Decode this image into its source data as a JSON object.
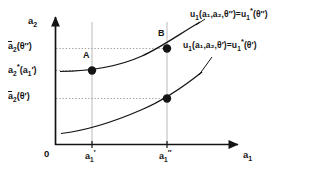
{
  "figure": {
    "type": "indifference-curve-diagram",
    "background": "#ffffff",
    "ink_color": "#141414",
    "guide_color": "#bdbdbd"
  },
  "axes": {
    "x_axis_label": "a",
    "x_axis_sub": "1",
    "y_axis_label": "a",
    "y_axis_sub": "2",
    "origin_label": "0",
    "x_ticks": [
      {
        "id": "a1-prime",
        "base": "a",
        "sub": "1",
        "prime": "′",
        "x_px": 92
      },
      {
        "id": "a1-double-prime",
        "base": "a",
        "sub": "1",
        "prime": "″",
        "x_px": 167
      }
    ],
    "y_ticks": [
      {
        "id": "abar2-theta-double-prime",
        "base": "a",
        "sub": "2",
        "overbar": true,
        "arg": "(θ″)",
        "y_px": 48
      },
      {
        "id": "a2-star-a1-prime",
        "base": "a",
        "sub": "2",
        "star": "*",
        "arg": "(a₁′)",
        "arg_base": "(a",
        "arg_sub": "1",
        "arg_prime": "′)",
        "y_px": 70
      },
      {
        "id": "abar2-theta-prime",
        "base": "a",
        "sub": "2",
        "overbar": true,
        "arg": "(θ′)",
        "y_px": 98
      }
    ]
  },
  "curves": [
    {
      "id": "upper-indifference-curve",
      "label_parts": {
        "u": "u",
        "u_sub": "1",
        "args": "(a₁,a₂,θ″)",
        "equals": "=",
        "u2": "u",
        "u2_sub": "1",
        "u2_sup": "*",
        "u2_args": "(θ″)"
      },
      "label_text": "u₁(a₁,a₂,θ″)=u₁*(θ″)",
      "label_x_px": 193,
      "label_y_px": 10,
      "path": "M 60,71.5 C 92,71 120,66 142,56 C 160,48 178,35 200,22"
    },
    {
      "id": "lower-indifference-curve",
      "label_parts": {
        "u": "u",
        "u_sub": "1",
        "args": "(a₁,a₂,θ′)",
        "equals": "=",
        "u2": "u",
        "u2_sub": "1",
        "u2_sup": "*",
        "u2_args": "(θ′)"
      },
      "label_text": "u₁(a₁,a₂,θ′)=u₁*(θ′)",
      "label_x_px": 186,
      "label_y_px": 41,
      "path": "M 61,133.5 C 90,130 118,120 141,110 C 160,102 182,88 202,72"
    }
  ],
  "points": [
    {
      "id": "point-A",
      "label": "A",
      "x_px": 92,
      "y_px": 70.5,
      "label_x_px": 84,
      "label_y_px": 55
    },
    {
      "id": "point-B",
      "label": "B",
      "x_px": 167,
      "y_px": 48.5,
      "label_x_px": 158,
      "label_y_px": 33
    },
    {
      "id": "point-lower",
      "label": "",
      "x_px": 167,
      "y_px": 98.5,
      "label_x_px": 0,
      "label_y_px": 0
    }
  ],
  "guides": {
    "vertical_lines": [
      {
        "id": "vline-a1-prime",
        "x_px": 92,
        "y_top_px": 22,
        "y_bottom_px": 145
      },
      {
        "id": "vline-a1-double-prime",
        "x_px": 167,
        "y_top_px": 22,
        "y_bottom_px": 145
      }
    ],
    "horizontal_dotted": [
      {
        "id": "hline-abar2-theta-double-prime",
        "y_px": 48.5,
        "x_left_px": 56,
        "x_right_px": 167
      },
      {
        "id": "hline-a2-star",
        "y_px": 70.5,
        "x_left_px": 56,
        "x_right_px": 92
      },
      {
        "id": "hline-abar2-theta-prime",
        "y_px": 98.5,
        "x_left_px": 56,
        "x_right_px": 167
      }
    ]
  }
}
